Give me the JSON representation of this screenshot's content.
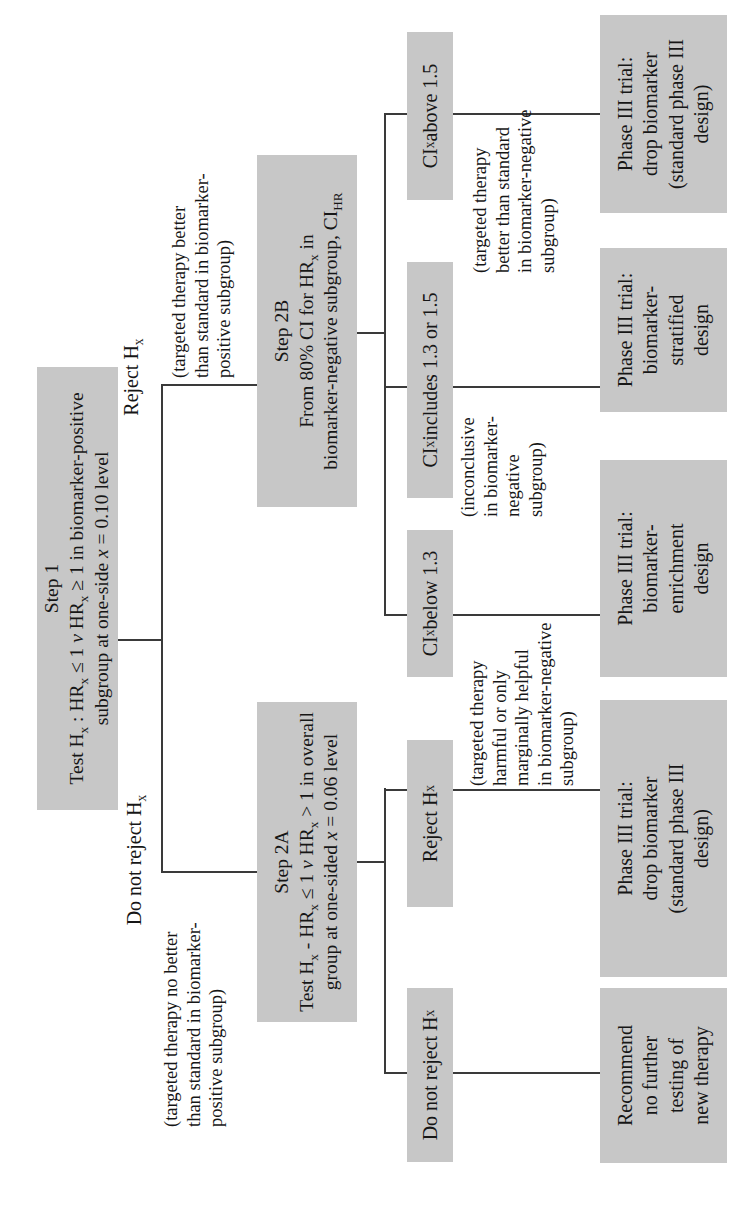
{
  "flowchart": {
    "step1": {
      "l1": "Step 1",
      "l2": "Test H_{x} : HR_{x} ≤ 1 *v* HR_{x} ≥ 1 in biomarker-positive",
      "l3": "subgroup at one-side *x* = 0.10 level"
    },
    "step2a": {
      "l1": "Step 2A",
      "l2": "Test H_{x} - HR_{x} ≤ 1 *v* HR_{x} > 1 in overall",
      "l3": "group at one-sided *x* = 0.06 level"
    },
    "step2b": {
      "l1": "Step 2B",
      "l2": "From 80% CI for HR_{x} in",
      "l3": "biomarker-negative subgroup, CI_{HR}"
    },
    "labels": {
      "reject": "Reject H_{x}",
      "do_not_reject": "Do not reject H_{x}"
    },
    "notes": {
      "no_better": "(targeted therapy no better\nthan standard in biomarker-\npositive subgroup)",
      "better_positive": "(targeted therapy better\nthan standard in biomarker-\npositive subgroup)",
      "harmful": "(targeted therapy\nharmful or only\nmarginally helpful\nin biomarker-negative\nsubgroup)",
      "inconclusive": "(inconclusive\nin biomarker-\nnegative\nsubgroup)",
      "better_negative": "(targeted therapy\nbetter than standard\nin biomarker-negative\nsubgroup)"
    },
    "branches_2a": {
      "do_not_reject": "Do not reject H_{x}",
      "reject": "Reject H_{x}"
    },
    "branches_2b": {
      "below": "CI_{x} below 1.3",
      "includes": "CI_{x} includes 1.3 or 1.5",
      "above": "CI_{x} above 1.5"
    },
    "terminals": {
      "recommend": "Recommend\nno further\ntesting of\nnew therapy",
      "drop_biomarker_2a": "Phase III trial:\ndrop biomarker\n(standard phase III\ndesign)",
      "enrichment": "Phase III trial:\nbiomarker-\nenrichment\ndesign",
      "stratified": "Phase III trial:\nbiomarker-\nstratified\ndesign",
      "drop_biomarker_2b": "Phase III trial:\ndrop biomarker\n(standard phase III\ndesign)"
    },
    "colors": {
      "box_fill": "#c7c7c7",
      "line": "#3a3a3a",
      "text": "#161616",
      "background": "#ffffff"
    }
  }
}
